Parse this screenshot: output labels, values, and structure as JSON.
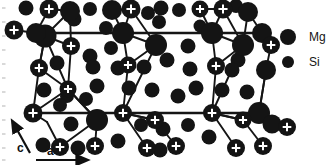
{
  "figure": {
    "kind": "crystal-structure-projection",
    "background_color": "#ffffff",
    "atom_color": "#141414",
    "bond_color": "#151515",
    "marker_color": "#ffffff"
  },
  "axes": {
    "c_label": "c",
    "a_label": "a",
    "c_arrow": {
      "x1": 30,
      "y1": 153,
      "x2": 15,
      "y2": 126
    },
    "a_arrow": {
      "x1": 36,
      "y1": 160,
      "x2": 82,
      "y2": 160
    },
    "c_label_pos": {
      "x": 17,
      "y": 152
    },
    "a_label_pos": {
      "x": 47,
      "y": 155
    }
  },
  "legend": {
    "items": [
      {
        "label": "Mg",
        "radius": 8.0,
        "cx": 288,
        "cy": 37,
        "text_x": 309,
        "text_y": 41
      },
      {
        "label": "Si",
        "radius": 6.0,
        "cx": 288,
        "cy": 62,
        "text_x": 309,
        "text_y": 66
      }
    ]
  },
  "edge_ticks": {
    "color": "#c9c9c9",
    "x": 2,
    "ys": [
      8,
      22,
      36,
      50,
      64,
      78,
      92,
      106,
      120,
      134,
      148,
      160
    ]
  },
  "unit_cell": {
    "top_line": {
      "x1": 36,
      "y1": 33,
      "x2": 262,
      "y2": 33
    },
    "bottom_line": {
      "x1": 33,
      "y1": 113,
      "x2": 259,
      "y2": 113
    }
  },
  "bonds": [
    {
      "x1": 36,
      "y1": 33,
      "x2": 49,
      "y2": 9
    },
    {
      "x1": 49,
      "y1": 9,
      "x2": 70,
      "y2": 11
    },
    {
      "x1": 36,
      "y1": 33,
      "x2": 45,
      "y2": 36
    },
    {
      "x1": 45,
      "y1": 36,
      "x2": 70,
      "y2": 11
    },
    {
      "x1": 45,
      "y1": 36,
      "x2": 71,
      "y2": 46
    },
    {
      "x1": 71,
      "y1": 46,
      "x2": 70,
      "y2": 11
    },
    {
      "x1": 45,
      "y1": 36,
      "x2": 39,
      "y2": 68
    },
    {
      "x1": 39,
      "y1": 68,
      "x2": 45,
      "y2": 36
    },
    {
      "x1": 39,
      "y1": 68,
      "x2": 33,
      "y2": 113
    },
    {
      "x1": 45,
      "y1": 36,
      "x2": 68,
      "y2": 89
    },
    {
      "x1": 68,
      "y1": 89,
      "x2": 71,
      "y2": 46
    },
    {
      "x1": 39,
      "y1": 68,
      "x2": 68,
      "y2": 89
    },
    {
      "x1": 33,
      "y1": 113,
      "x2": 68,
      "y2": 89
    },
    {
      "x1": 33,
      "y1": 113,
      "x2": 47,
      "y2": 122
    },
    {
      "x1": 47,
      "y1": 122,
      "x2": 60,
      "y2": 147
    },
    {
      "x1": 68,
      "y1": 89,
      "x2": 97,
      "y2": 120
    },
    {
      "x1": 97,
      "y1": 120,
      "x2": 95,
      "y2": 146
    },
    {
      "x1": 97,
      "y1": 120,
      "x2": 60,
      "y2": 147
    },
    {
      "x1": 123,
      "y1": 33,
      "x2": 112,
      "y2": 10
    },
    {
      "x1": 112,
      "y1": 10,
      "x2": 131,
      "y2": 9
    },
    {
      "x1": 123,
      "y1": 33,
      "x2": 131,
      "y2": 9
    },
    {
      "x1": 131,
      "y1": 9,
      "x2": 156,
      "y2": 45
    },
    {
      "x1": 123,
      "y1": 33,
      "x2": 156,
      "y2": 45
    },
    {
      "x1": 123,
      "y1": 33,
      "x2": 128,
      "y2": 65
    },
    {
      "x1": 128,
      "y1": 65,
      "x2": 156,
      "y2": 45
    },
    {
      "x1": 128,
      "y1": 65,
      "x2": 123,
      "y2": 113
    },
    {
      "x1": 123,
      "y1": 113,
      "x2": 156,
      "y2": 45
    },
    {
      "x1": 123,
      "y1": 113,
      "x2": 155,
      "y2": 120
    },
    {
      "x1": 155,
      "y1": 120,
      "x2": 176,
      "y2": 146
    },
    {
      "x1": 123,
      "y1": 113,
      "x2": 147,
      "y2": 148
    },
    {
      "x1": 212,
      "y1": 33,
      "x2": 223,
      "y2": 9
    },
    {
      "x1": 223,
      "y1": 9,
      "x2": 200,
      "y2": 9
    },
    {
      "x1": 212,
      "y1": 33,
      "x2": 200,
      "y2": 9
    },
    {
      "x1": 212,
      "y1": 33,
      "x2": 243,
      "y2": 45
    },
    {
      "x1": 223,
      "y1": 9,
      "x2": 243,
      "y2": 45
    },
    {
      "x1": 243,
      "y1": 45,
      "x2": 248,
      "y2": 12
    },
    {
      "x1": 212,
      "y1": 33,
      "x2": 216,
      "y2": 66
    },
    {
      "x1": 216,
      "y1": 66,
      "x2": 243,
      "y2": 45
    },
    {
      "x1": 216,
      "y1": 66,
      "x2": 212,
      "y2": 113
    },
    {
      "x1": 212,
      "y1": 113,
      "x2": 243,
      "y2": 45
    },
    {
      "x1": 212,
      "y1": 113,
      "x2": 243,
      "y2": 120
    },
    {
      "x1": 243,
      "y1": 120,
      "x2": 263,
      "y2": 146
    },
    {
      "x1": 212,
      "y1": 113,
      "x2": 236,
      "y2": 148
    },
    {
      "x1": 262,
      "y1": 33,
      "x2": 271,
      "y2": 45
    },
    {
      "x1": 259,
      "y1": 113,
      "x2": 272,
      "y2": 124
    },
    {
      "x1": 272,
      "y1": 124,
      "x2": 287,
      "y2": 127
    },
    {
      "x1": 271,
      "y1": 45,
      "x2": 266,
      "y2": 70
    },
    {
      "x1": 266,
      "y1": 70,
      "x2": 259,
      "y2": 113
    },
    {
      "x1": 259,
      "y1": 113,
      "x2": 266,
      "y2": 70
    },
    {
      "x1": 155,
      "y1": 120,
      "x2": 123,
      "y2": 113
    },
    {
      "x1": 243,
      "y1": 120,
      "x2": 212,
      "y2": 113
    },
    {
      "x1": 97,
      "y1": 120,
      "x2": 68,
      "y2": 89
    },
    {
      "x1": 36,
      "y1": 33,
      "x2": 14,
      "y2": 30
    },
    {
      "x1": 262,
      "y1": 33,
      "x2": 248,
      "y2": 12
    }
  ],
  "atoms_mg_plus": [
    {
      "cx": 49,
      "cy": 9,
      "r": 9.5
    },
    {
      "cx": 14,
      "cy": 30,
      "r": 9.5
    },
    {
      "cx": 71,
      "cy": 46,
      "r": 9.0
    },
    {
      "cx": 39,
      "cy": 68,
      "r": 9.0
    },
    {
      "cx": 68,
      "cy": 89,
      "r": 8.5
    },
    {
      "cx": 33,
      "cy": 113,
      "r": 9.5
    },
    {
      "cx": 95,
      "cy": 146,
      "r": 9.0
    },
    {
      "cx": 131,
      "cy": 9,
      "r": 9.5
    },
    {
      "cx": 128,
      "cy": 65,
      "r": 8.5
    },
    {
      "cx": 123,
      "cy": 113,
      "r": 9.0
    },
    {
      "cx": 155,
      "cy": 120,
      "r": 9.0
    },
    {
      "cx": 176,
      "cy": 146,
      "r": 9.0
    },
    {
      "cx": 223,
      "cy": 9,
      "r": 9.5
    },
    {
      "cx": 200,
      "cy": 9,
      "r": 8.5
    },
    {
      "cx": 216,
      "cy": 66,
      "r": 9.0
    },
    {
      "cx": 212,
      "cy": 113,
      "r": 9.0
    },
    {
      "cx": 243,
      "cy": 120,
      "r": 8.5
    },
    {
      "cx": 263,
      "cy": 146,
      "r": 9.0
    },
    {
      "cx": 271,
      "cy": 45,
      "r": 9.0
    },
    {
      "cx": 287,
      "cy": 127,
      "r": 9.0
    },
    {
      "cx": 236,
      "cy": 148,
      "r": 9.0
    },
    {
      "cx": 60,
      "cy": 147,
      "r": 9.0
    },
    {
      "cx": 147,
      "cy": 148,
      "r": 9.0
    }
  ],
  "atoms_mg_plain": [
    {
      "cx": 45,
      "cy": 36,
      "r": 11.5
    },
    {
      "cx": 123,
      "cy": 33,
      "r": 11.0
    },
    {
      "cx": 212,
      "cy": 33,
      "r": 11.0
    },
    {
      "cx": 156,
      "cy": 45,
      "r": 11.0
    },
    {
      "cx": 243,
      "cy": 45,
      "r": 11.0
    },
    {
      "cx": 97,
      "cy": 120,
      "r": 11.0
    },
    {
      "cx": 70,
      "cy": 11,
      "r": 10.0
    },
    {
      "cx": 112,
      "cy": 10,
      "r": 10.0
    },
    {
      "cx": 248,
      "cy": 12,
      "r": 10.0
    },
    {
      "cx": 266,
      "cy": 70,
      "r": 10.0
    },
    {
      "cx": 259,
      "cy": 113,
      "r": 11.0
    },
    {
      "cx": 272,
      "cy": 124,
      "r": 9.5
    },
    {
      "cx": 262,
      "cy": 33,
      "r": 10.0
    },
    {
      "cx": 36,
      "cy": 33,
      "r": 10.0
    }
  ],
  "atoms_si": [
    {
      "cx": 26,
      "cy": 8,
      "r": 7.5
    },
    {
      "cx": 69,
      "cy": 16,
      "r": 6.5
    },
    {
      "cx": 90,
      "cy": 9,
      "r": 7.0
    },
    {
      "cx": 148,
      "cy": 13,
      "r": 7.0
    },
    {
      "cx": 161,
      "cy": 8,
      "r": 7.5
    },
    {
      "cx": 179,
      "cy": 10,
      "r": 7.0
    },
    {
      "cx": 200,
      "cy": 26,
      "r": 6.5
    },
    {
      "cx": 74,
      "cy": 19,
      "r": 7.5
    },
    {
      "cx": 159,
      "cy": 22,
      "r": 7.0
    },
    {
      "cx": 70,
      "cy": 45,
      "r": 7.0
    },
    {
      "cx": 90,
      "cy": 56,
      "r": 7.5
    },
    {
      "cx": 111,
      "cy": 48,
      "r": 7.0
    },
    {
      "cx": 93,
      "cy": 67,
      "r": 7.5
    },
    {
      "cx": 118,
      "cy": 68,
      "r": 7.5
    },
    {
      "cx": 144,
      "cy": 67,
      "r": 7.5
    },
    {
      "cx": 167,
      "cy": 60,
      "r": 7.5
    },
    {
      "cx": 190,
      "cy": 69,
      "r": 7.5
    },
    {
      "cx": 238,
      "cy": 60,
      "r": 7.5
    },
    {
      "cx": 57,
      "cy": 63,
      "r": 7.5
    },
    {
      "cx": 44,
      "cy": 90,
      "r": 7.5
    },
    {
      "cx": 67,
      "cy": 96,
      "r": 7.0
    },
    {
      "cx": 97,
      "cy": 86,
      "r": 7.5
    },
    {
      "cx": 129,
      "cy": 88,
      "r": 7.5
    },
    {
      "cx": 152,
      "cy": 90,
      "r": 7.5
    },
    {
      "cx": 178,
      "cy": 96,
      "r": 7.5
    },
    {
      "cx": 196,
      "cy": 88,
      "r": 7.5
    },
    {
      "cx": 222,
      "cy": 90,
      "r": 7.5
    },
    {
      "cx": 247,
      "cy": 92,
      "r": 7.5
    },
    {
      "cx": 232,
      "cy": 70,
      "r": 7.5
    },
    {
      "cx": 43,
      "cy": 145,
      "r": 7.5
    },
    {
      "cx": 78,
      "cy": 148,
      "r": 7.5
    },
    {
      "cx": 118,
      "cy": 141,
      "r": 7.5
    },
    {
      "cx": 141,
      "cy": 125,
      "r": 7.0
    },
    {
      "cx": 163,
      "cy": 129,
      "r": 7.5
    },
    {
      "cx": 160,
      "cy": 150,
      "r": 7.5
    },
    {
      "cx": 209,
      "cy": 137,
      "r": 7.5
    },
    {
      "cx": 71,
      "cy": 124,
      "r": 7.5
    },
    {
      "cx": 86,
      "cy": 99,
      "r": 7.0
    },
    {
      "cx": 188,
      "cy": 125,
      "r": 7.0
    },
    {
      "cx": 236,
      "cy": 6,
      "r": 7.0
    },
    {
      "cx": 188,
      "cy": 46,
      "r": 7.5
    },
    {
      "cx": 106,
      "cy": 28,
      "r": 7.0
    },
    {
      "cx": 60,
      "cy": 105,
      "r": 7.0
    }
  ]
}
